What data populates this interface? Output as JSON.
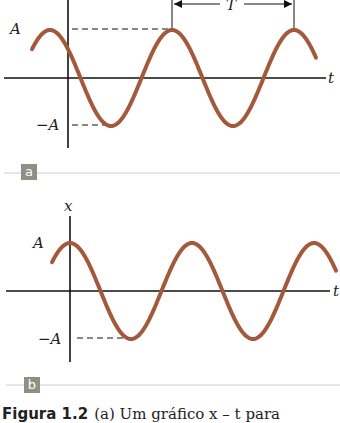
{
  "panels": [
    {
      "id": "a",
      "tag": "a",
      "y_labels": {
        "top": "A",
        "bottom": "−A"
      },
      "x_label": "t",
      "period_label": "T",
      "phase": "sine-shifted (peak before origin)"
    },
    {
      "id": "b",
      "tag": "b",
      "axis_label": "x",
      "y_labels": {
        "top": "A",
        "bottom": "−A"
      },
      "x_label": "t",
      "phase": "cosine (peak at origin)"
    }
  ],
  "caption": {
    "figure_number": "Figura 1.2",
    "text": "(a) Um gráfico x – t para"
  },
  "colors": {
    "curve": "#a35a3c",
    "axis": "#111111",
    "tag_bg": "#8d9184",
    "divider": "#cccccc"
  }
}
